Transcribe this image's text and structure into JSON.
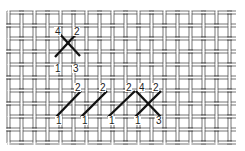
{
  "diagram": {
    "title": "",
    "colors": {
      "thread": "#3a3a3a",
      "stitch": "#111111",
      "background": "#ffffff"
    },
    "grid": {
      "x_start": 7,
      "x_end": 236,
      "y_start": 11,
      "y_end": 143,
      "cell": 13,
      "pair_gap": 3
    },
    "stitches": [
      {
        "id": "cross-top-a",
        "x1": 55,
        "y1": 57,
        "x2": 79,
        "y2": 31
      },
      {
        "id": "cross-top-b",
        "x1": 57,
        "y1": 31,
        "x2": 80,
        "y2": 56
      },
      {
        "id": "half-1",
        "x1": 56,
        "y1": 117,
        "x2": 81,
        "y2": 91
      },
      {
        "id": "half-2",
        "x1": 81,
        "y1": 117,
        "x2": 107,
        "y2": 91
      },
      {
        "id": "half-3",
        "x1": 108,
        "y1": 117,
        "x2": 135,
        "y2": 91
      },
      {
        "id": "half-4",
        "x1": 135,
        "y1": 117,
        "x2": 161,
        "y2": 91
      },
      {
        "id": "cross-row-b",
        "x1": 136,
        "y1": 91,
        "x2": 161,
        "y2": 117
      }
    ],
    "labels": [
      {
        "text": "4",
        "x": 55,
        "y": 35
      },
      {
        "text": "2",
        "x": 74,
        "y": 35
      },
      {
        "text": "1",
        "x": 55,
        "y": 72
      },
      {
        "text": "3",
        "x": 73,
        "y": 72
      },
      {
        "text": "2",
        "x": 75,
        "y": 91
      },
      {
        "text": "2",
        "x": 100,
        "y": 91
      },
      {
        "text": "2",
        "x": 126,
        "y": 91
      },
      {
        "text": "4",
        "x": 139,
        "y": 91
      },
      {
        "text": "2",
        "x": 153,
        "y": 91
      },
      {
        "text": "1",
        "x": 56,
        "y": 124
      },
      {
        "text": "1",
        "x": 82,
        "y": 124
      },
      {
        "text": "1",
        "x": 109,
        "y": 124
      },
      {
        "text": "1",
        "x": 135,
        "y": 124
      },
      {
        "text": "3",
        "x": 156,
        "y": 124
      }
    ]
  }
}
